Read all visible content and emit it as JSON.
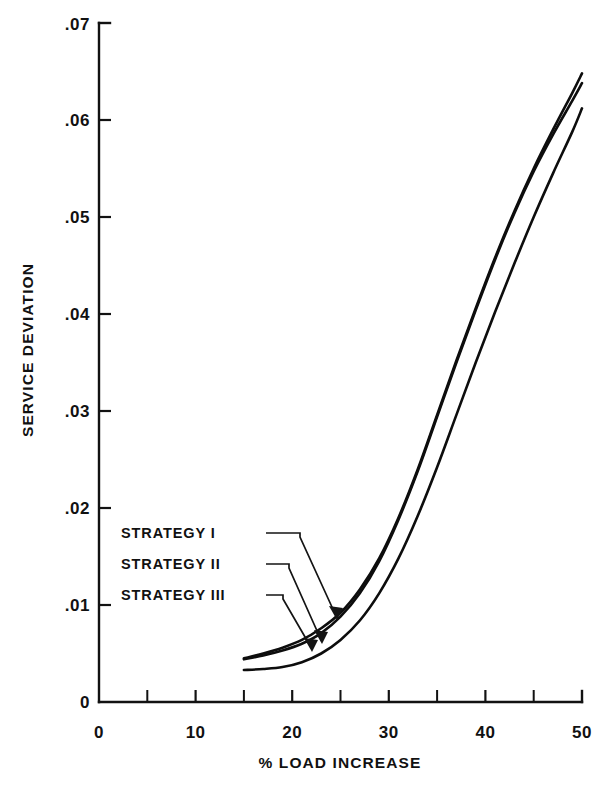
{
  "chart_data": {
    "type": "line",
    "title": "",
    "xlabel": "% LOAD INCREASE",
    "ylabel": "SERVICE DEVIATION",
    "xlim": [
      0,
      50
    ],
    "ylim": [
      0,
      0.07
    ],
    "grid": false,
    "legend_position": "inside-left",
    "x_ticks_major": [
      0,
      10,
      20,
      30,
      40,
      50
    ],
    "x_tick_labels": [
      "0",
      "10",
      "20",
      "30",
      "40",
      "50"
    ],
    "x_ticks_minor": [
      5,
      15,
      25,
      35,
      45
    ],
    "y_ticks_major": [
      0,
      0.01,
      0.02,
      0.03,
      0.04,
      0.05,
      0.06,
      0.07
    ],
    "y_tick_labels": [
      "0",
      ".01",
      ".02",
      ".03",
      ".04",
      ".05",
      ".06",
      ".07"
    ],
    "series": [
      {
        "name": "STRATEGY I",
        "x": [
          15,
          17,
          19,
          21,
          23,
          25,
          27,
          29,
          31,
          33,
          35,
          37,
          39,
          41,
          43,
          45,
          47,
          49,
          50
        ],
        "values": [
          0.0045,
          0.005,
          0.0056,
          0.0064,
          0.0076,
          0.0092,
          0.0116,
          0.0148,
          0.019,
          0.024,
          0.0296,
          0.0352,
          0.0406,
          0.0458,
          0.0506,
          0.055,
          0.059,
          0.0628,
          0.0648
        ]
      },
      {
        "name": "STRATEGY II",
        "x": [
          15,
          17,
          19,
          21,
          23,
          25,
          27,
          29,
          31,
          33,
          35,
          37,
          39,
          41,
          43,
          45,
          47,
          49,
          50
        ],
        "values": [
          0.0044,
          0.0048,
          0.0053,
          0.006,
          0.0071,
          0.0088,
          0.0112,
          0.0145,
          0.0188,
          0.0238,
          0.0294,
          0.035,
          0.0404,
          0.0456,
          0.0504,
          0.0547,
          0.0585,
          0.062,
          0.0638
        ]
      },
      {
        "name": "STRATEGY III",
        "x": [
          15,
          17,
          19,
          21,
          23,
          25,
          27,
          29,
          31,
          33,
          35,
          37,
          39,
          41,
          43,
          45,
          47,
          49,
          50
        ],
        "values": [
          0.0033,
          0.0034,
          0.0036,
          0.0041,
          0.005,
          0.0064,
          0.0084,
          0.0112,
          0.0148,
          0.0192,
          0.0242,
          0.0296,
          0.035,
          0.0402,
          0.0452,
          0.05,
          0.0545,
          0.0588,
          0.0612
        ]
      }
    ],
    "annotations": [
      {
        "label": "STRATEGY I",
        "points_to_x": 24.0,
        "points_to_y": 0.0088
      },
      {
        "label": "STRATEGY II",
        "points_to_x": 22.5,
        "points_to_y": 0.007
      },
      {
        "label": "STRATEGY III",
        "points_to_x": 23.2,
        "points_to_y": 0.0062
      }
    ]
  },
  "legend": {
    "items": [
      {
        "label": "STRATEGY I"
      },
      {
        "label": "STRATEGY II"
      },
      {
        "label": "STRATEGY III"
      }
    ]
  },
  "axes": {
    "y_title": "SERVICE DEVIATION",
    "x_title": "% LOAD INCREASE",
    "y_labels": {
      "t0": "0",
      "t1": ".01",
      "t2": ".02",
      "t3": ".03",
      "t4": ".04",
      "t5": ".05",
      "t6": ".06",
      "t7": ".07"
    },
    "x_labels": {
      "t0": "0",
      "t10": "10",
      "t20": "20",
      "t30": "30",
      "t40": "40",
      "t50": "50"
    }
  },
  "colors": {
    "ink": "#0d0d0d",
    "paper": "#ffffff"
  }
}
